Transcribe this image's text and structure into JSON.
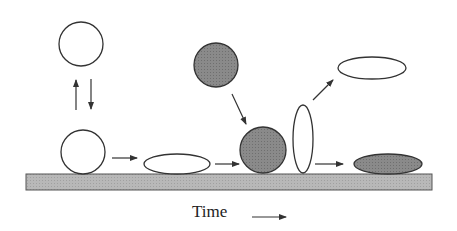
{
  "diagram": {
    "axis_label": "Time",
    "colors": {
      "stroke": "#333333",
      "open_fill": "#ffffff",
      "filled": "#8a8a8a",
      "substrate": "#b5b5b5"
    },
    "elements": [
      {
        "id": "free-particle-open",
        "shape": "circle",
        "fill": "open"
      },
      {
        "id": "adsorbed-particle-open",
        "shape": "circle",
        "fill": "open"
      },
      {
        "id": "spread-particle-open",
        "shape": "flat-ellipse",
        "fill": "open"
      },
      {
        "id": "free-particle-filled",
        "shape": "circle",
        "fill": "filled"
      },
      {
        "id": "adsorbed-particle-filled",
        "shape": "circle",
        "fill": "filled"
      },
      {
        "id": "upright-particle-open",
        "shape": "tall-ellipse",
        "fill": "open"
      },
      {
        "id": "desorbed-particle-open",
        "shape": "flat-ellipse",
        "fill": "open"
      },
      {
        "id": "spread-particle-filled",
        "shape": "flat-ellipse",
        "fill": "filled"
      }
    ]
  }
}
